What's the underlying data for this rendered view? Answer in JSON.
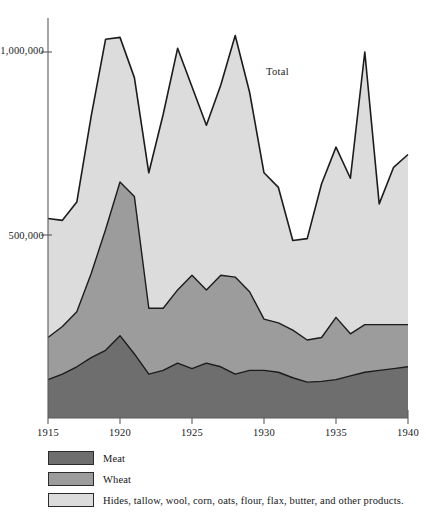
{
  "chart_data": {
    "type": "area",
    "title": "",
    "subtitle": "",
    "xlabel": "",
    "ylabel": "",
    "stacked": true,
    "grid": false,
    "legend_position": "bottom-left",
    "xlim": [
      1915,
      1940
    ],
    "ylim": [
      0,
      1100000
    ],
    "xticks": [
      1915,
      1920,
      1925,
      1930,
      1935,
      1940
    ],
    "xtick_labels": [
      "1915",
      "1920",
      "1925",
      "1930",
      "1935",
      "1940"
    ],
    "yticks": [
      500000,
      1000000
    ],
    "ytick_labels": [
      "500,000",
      "1,000,000"
    ],
    "annotations": [
      {
        "text": "Total",
        "x": 1930.3,
        "y": 790000
      }
    ],
    "x": [
      1915,
      1916,
      1917,
      1918,
      1919,
      1920,
      1921,
      1922,
      1923,
      1924,
      1925,
      1926,
      1927,
      1928,
      1929,
      1930,
      1931,
      1932,
      1933,
      1934,
      1935,
      1936,
      1937,
      1938,
      1939,
      1940
    ],
    "series": [
      {
        "name": "Meat",
        "color": "#6e6e6e",
        "values": [
          105000,
          120000,
          140000,
          165000,
          185000,
          225000,
          175000,
          120000,
          130000,
          150000,
          135000,
          150000,
          140000,
          120000,
          130000,
          130000,
          125000,
          110000,
          98000,
          100000,
          105000,
          115000,
          125000,
          130000,
          135000,
          140000
        ]
      },
      {
        "name": "Wheat",
        "color": "#9c9c9c",
        "values": [
          115000,
          130000,
          150000,
          230000,
          330000,
          420000,
          430000,
          180000,
          170000,
          200000,
          255000,
          200000,
          250000,
          265000,
          215000,
          140000,
          135000,
          130000,
          115000,
          120000,
          170000,
          115000,
          130000,
          125000,
          120000,
          115000
        ]
      },
      {
        "name": "Hides, tallow, wool, corn, oats, flour, flax, butter, and other products.",
        "color": "#dcdcdc",
        "values": [
          325000,
          290000,
          300000,
          430000,
          520000,
          395000,
          325000,
          370000,
          530000,
          660000,
          515000,
          450000,
          520000,
          660000,
          545000,
          400000,
          370000,
          245000,
          277000,
          420000,
          465000,
          425000,
          745000,
          330000,
          430000,
          465000
        ]
      }
    ],
    "total_values": [
      545000,
      540000,
      590000,
      825000,
      1035000,
      1040000,
      930000,
      670000,
      830000,
      1010000,
      905000,
      800000,
      910000,
      1045000,
      890000,
      670000,
      630000,
      485000,
      490000,
      640000,
      740000,
      655000,
      1000000,
      585000,
      685000,
      720000
    ]
  },
  "legend": {
    "items": [
      {
        "label": "Meat",
        "color": "#6e6e6e"
      },
      {
        "label": "Wheat",
        "color": "#9c9c9c"
      },
      {
        "label": "Hides, tallow, wool, corn, oats, flour, flax, butter, and other products.",
        "color": "#dcdcdc"
      }
    ]
  },
  "axis": {
    "y_labels": [
      "1,000,000",
      "500,000"
    ],
    "x_labels": [
      "1915",
      "1920",
      "1925",
      "1930",
      "1935",
      "1940"
    ]
  },
  "annotation": {
    "total": "Total"
  },
  "colors": {
    "meat": "#6e6e6e",
    "wheat": "#9c9c9c",
    "other": "#dcdcdc",
    "axis": "#5a5a5a",
    "outline": "#1c1c1c"
  }
}
